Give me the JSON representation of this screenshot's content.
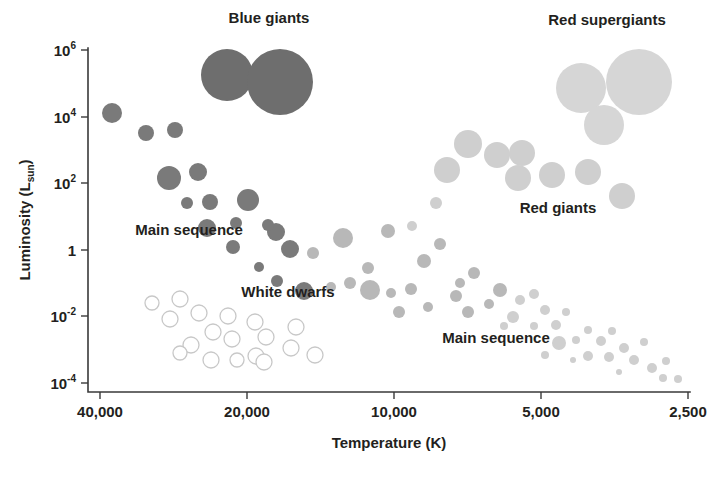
{
  "figure": {
    "kind": "hertzsprung-russell-diagram",
    "background_color": "#ffffff"
  },
  "chart_data": {
    "type": "scatter",
    "title": "",
    "xlabel": "Temperature (K)",
    "ylabel": "Luminosity (L",
    "ylabel_sub": "sun",
    "ylabel_close": ")",
    "xlabel_text": "Temperature (K)",
    "grid": false,
    "legend_position": "none",
    "x_axis": {
      "label": "Temperature (K)",
      "scale": "log-reversed",
      "tick_labels": [
        "40,000",
        "20,000",
        "10,000",
        "5,000",
        "2,500"
      ],
      "tick_values": [
        40000,
        20000,
        10000,
        5000,
        2500
      ],
      "tick_x_px": [
        100,
        247,
        394,
        541,
        688
      ],
      "min": 44000,
      "max": 2400,
      "direction": "decreasing"
    },
    "y_axis": {
      "label": "Luminosity (L_sun)",
      "scale": "log",
      "tick_labels": [
        "10⁶",
        "10⁴",
        "10²",
        "1",
        "10⁻²",
        "10⁻⁴"
      ],
      "tick_mantissas": [
        "10",
        "10",
        "10",
        "1",
        "10",
        "10"
      ],
      "tick_exponents": [
        "6",
        "4",
        "2",
        "",
        "-2",
        "-4"
      ],
      "tick_values": [
        1000000,
        10000,
        100,
        1,
        0.01,
        0.0001
      ],
      "tick_y_px": [
        50,
        117,
        183,
        250,
        316,
        383
      ],
      "min_exp": -4.6,
      "max_exp": 6.6
    },
    "colors": {
      "blue_giant": "#6e6e6e",
      "hot_main_sequence": "#7a7a7a",
      "mid_main_sequence": "#b0b0b0",
      "cool_main_sequence": "#cfcfcf",
      "red_giant": "#cfcfcf",
      "red_supergiant": "#d6d6d6",
      "white_dwarf_fill": "#ffffff",
      "white_dwarf_stroke": "#c8c8c8",
      "axis": "#3a3a3a",
      "text": "#231f20"
    },
    "annotations": [
      {
        "id": "blue-giants",
        "text": "Blue giants",
        "x_px": 269,
        "y_px": 23
      },
      {
        "id": "red-supergiants",
        "text": "Red supergiants",
        "x_px": 607,
        "y_px": 25
      },
      {
        "id": "main-sequence-hot",
        "text": "Main sequence",
        "x_px": 189,
        "y_px": 235
      },
      {
        "id": "white-dwarfs",
        "text": "White dwarfs",
        "x_px": 288,
        "y_px": 297
      },
      {
        "id": "red-giants",
        "text": "Red giants",
        "x_px": 558,
        "y_px": 213
      },
      {
        "id": "main-sequence-cool",
        "text": "Main sequence",
        "x_px": 496,
        "y_px": 343
      }
    ],
    "series": [
      {
        "name": "Blue giants",
        "color": "#6e6e6e",
        "filled": true,
        "points": [
          {
            "x_px": 227,
            "y_px": 75,
            "r": 26
          },
          {
            "x_px": 280,
            "y_px": 82,
            "r": 33
          }
        ]
      },
      {
        "name": "Red supergiants",
        "color": "#d6d6d6",
        "filled": true,
        "points": [
          {
            "x_px": 581,
            "y_px": 88,
            "r": 25
          },
          {
            "x_px": 639,
            "y_px": 82,
            "r": 33
          },
          {
            "x_px": 604,
            "y_px": 125,
            "r": 20
          }
        ]
      },
      {
        "name": "Main sequence (hot)",
        "color": "#7a7a7a",
        "filled": true,
        "points": [
          {
            "x_px": 112,
            "y_px": 113,
            "r": 10
          },
          {
            "x_px": 146,
            "y_px": 133,
            "r": 8
          },
          {
            "x_px": 175,
            "y_px": 130,
            "r": 8
          },
          {
            "x_px": 169,
            "y_px": 178,
            "r": 12
          },
          {
            "x_px": 198,
            "y_px": 172,
            "r": 9
          },
          {
            "x_px": 187,
            "y_px": 203,
            "r": 6
          },
          {
            "x_px": 210,
            "y_px": 202,
            "r": 8
          },
          {
            "x_px": 248,
            "y_px": 200,
            "r": 11
          },
          {
            "x_px": 207,
            "y_px": 228,
            "r": 9
          },
          {
            "x_px": 236,
            "y_px": 223,
            "r": 6
          },
          {
            "x_px": 233,
            "y_px": 247,
            "r": 7
          },
          {
            "x_px": 276,
            "y_px": 232,
            "r": 9
          },
          {
            "x_px": 268,
            "y_px": 225,
            "r": 6
          },
          {
            "x_px": 290,
            "y_px": 249,
            "r": 9
          },
          {
            "x_px": 277,
            "y_px": 281,
            "r": 6
          },
          {
            "x_px": 304,
            "y_px": 291,
            "r": 9
          },
          {
            "x_px": 259,
            "y_px": 267,
            "r": 5
          }
        ]
      },
      {
        "name": "Main sequence (intermediate)",
        "color": "#b8b8b8",
        "filled": true,
        "points": [
          {
            "x_px": 343,
            "y_px": 238,
            "r": 10
          },
          {
            "x_px": 313,
            "y_px": 253,
            "r": 6
          },
          {
            "x_px": 388,
            "y_px": 231,
            "r": 7
          },
          {
            "x_px": 368,
            "y_px": 268,
            "r": 6
          },
          {
            "x_px": 424,
            "y_px": 261,
            "r": 7
          },
          {
            "x_px": 440,
            "y_px": 244,
            "r": 6
          },
          {
            "x_px": 411,
            "y_px": 289,
            "r": 6
          },
          {
            "x_px": 370,
            "y_px": 290,
            "r": 10
          },
          {
            "x_px": 391,
            "y_px": 293,
            "r": 5
          },
          {
            "x_px": 399,
            "y_px": 312,
            "r": 6
          },
          {
            "x_px": 428,
            "y_px": 307,
            "r": 5
          },
          {
            "x_px": 456,
            "y_px": 296,
            "r": 6
          },
          {
            "x_px": 460,
            "y_px": 283,
            "r": 5
          },
          {
            "x_px": 474,
            "y_px": 273,
            "r": 6
          },
          {
            "x_px": 468,
            "y_px": 312,
            "r": 6
          },
          {
            "x_px": 489,
            "y_px": 304,
            "r": 5
          },
          {
            "x_px": 500,
            "y_px": 290,
            "r": 7
          },
          {
            "x_px": 331,
            "y_px": 287,
            "r": 5
          },
          {
            "x_px": 350,
            "y_px": 283,
            "r": 6
          }
        ]
      },
      {
        "name": "Main sequence (cool)",
        "color": "#cfcfcf",
        "filled": true,
        "points": [
          {
            "x_px": 513,
            "y_px": 317,
            "r": 6
          },
          {
            "x_px": 520,
            "y_px": 300,
            "r": 5
          },
          {
            "x_px": 534,
            "y_px": 294,
            "r": 5
          },
          {
            "x_px": 545,
            "y_px": 310,
            "r": 5
          },
          {
            "x_px": 534,
            "y_px": 326,
            "r": 4
          },
          {
            "x_px": 556,
            "y_px": 325,
            "r": 5
          },
          {
            "x_px": 566,
            "y_px": 312,
            "r": 4
          },
          {
            "x_px": 559,
            "y_px": 343,
            "r": 7
          },
          {
            "x_px": 576,
            "y_px": 340,
            "r": 4
          },
          {
            "x_px": 588,
            "y_px": 330,
            "r": 4
          },
          {
            "x_px": 601,
            "y_px": 341,
            "r": 5
          },
          {
            "x_px": 612,
            "y_px": 331,
            "r": 4
          },
          {
            "x_px": 588,
            "y_px": 356,
            "r": 5
          },
          {
            "x_px": 609,
            "y_px": 357,
            "r": 5
          },
          {
            "x_px": 624,
            "y_px": 348,
            "r": 5
          },
          {
            "x_px": 634,
            "y_px": 360,
            "r": 5
          },
          {
            "x_px": 644,
            "y_px": 342,
            "r": 4
          },
          {
            "x_px": 652,
            "y_px": 368,
            "r": 5
          },
          {
            "x_px": 666,
            "y_px": 361,
            "r": 4
          },
          {
            "x_px": 663,
            "y_px": 378,
            "r": 4
          },
          {
            "x_px": 678,
            "y_px": 379,
            "r": 4
          },
          {
            "x_px": 504,
            "y_px": 326,
            "r": 4
          },
          {
            "x_px": 545,
            "y_px": 355,
            "r": 4
          },
          {
            "x_px": 573,
            "y_px": 360,
            "r": 3
          },
          {
            "x_px": 619,
            "y_px": 372,
            "r": 3
          }
        ]
      },
      {
        "name": "Red giants",
        "color": "#cfcfcf",
        "filled": true,
        "points": [
          {
            "x_px": 447,
            "y_px": 170,
            "r": 13
          },
          {
            "x_px": 468,
            "y_px": 144,
            "r": 14
          },
          {
            "x_px": 497,
            "y_px": 155,
            "r": 13
          },
          {
            "x_px": 522,
            "y_px": 153,
            "r": 13
          },
          {
            "x_px": 518,
            "y_px": 178,
            "r": 13
          },
          {
            "x_px": 552,
            "y_px": 175,
            "r": 13
          },
          {
            "x_px": 588,
            "y_px": 172,
            "r": 13
          },
          {
            "x_px": 622,
            "y_px": 196,
            "r": 13
          },
          {
            "x_px": 436,
            "y_px": 203,
            "r": 6
          },
          {
            "x_px": 412,
            "y_px": 226,
            "r": 5
          }
        ]
      },
      {
        "name": "White dwarfs",
        "color": "#ffffff",
        "filled": false,
        "points": [
          {
            "x_px": 152,
            "y_px": 303,
            "r": 7
          },
          {
            "x_px": 180,
            "y_px": 299,
            "r": 8
          },
          {
            "x_px": 170,
            "y_px": 319,
            "r": 8
          },
          {
            "x_px": 199,
            "y_px": 313,
            "r": 8
          },
          {
            "x_px": 228,
            "y_px": 316,
            "r": 8
          },
          {
            "x_px": 255,
            "y_px": 322,
            "r": 8
          },
          {
            "x_px": 213,
            "y_px": 332,
            "r": 8
          },
          {
            "x_px": 191,
            "y_px": 345,
            "r": 8
          },
          {
            "x_px": 232,
            "y_px": 339,
            "r": 8
          },
          {
            "x_px": 266,
            "y_px": 337,
            "r": 8
          },
          {
            "x_px": 296,
            "y_px": 327,
            "r": 8
          },
          {
            "x_px": 291,
            "y_px": 348,
            "r": 8
          },
          {
            "x_px": 256,
            "y_px": 356,
            "r": 8
          },
          {
            "x_px": 211,
            "y_px": 360,
            "r": 8
          },
          {
            "x_px": 264,
            "y_px": 362,
            "r": 8
          },
          {
            "x_px": 315,
            "y_px": 355,
            "r": 8
          },
          {
            "x_px": 180,
            "y_px": 353,
            "r": 7
          },
          {
            "x_px": 237,
            "y_px": 360,
            "r": 7
          }
        ]
      }
    ]
  }
}
